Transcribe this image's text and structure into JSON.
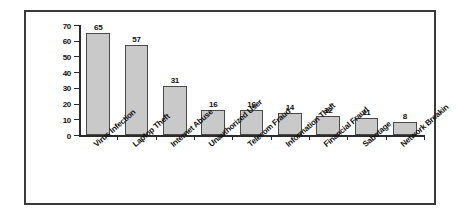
{
  "chart_data": {
    "type": "bar",
    "title": "",
    "subtitle": "",
    "xlabel": "",
    "ylabel": "",
    "ylim": [
      0,
      70
    ],
    "yticks": [
      0,
      10,
      20,
      30,
      40,
      50,
      60,
      70
    ],
    "grid": false,
    "legend": "none",
    "show_value_labels": true,
    "xtick_label_rotation": -41,
    "categories": [
      "Virus Infection",
      "Laptop Theft",
      "Internet Abuse",
      "Unauthorized User",
      "Telecom Fraud",
      "Information Theft",
      "Financial Fraud",
      "Sabotage",
      "Network Breakin"
    ],
    "values": [
      65,
      57,
      31,
      16,
      16,
      14,
      12,
      11,
      8
    ],
    "value_labels": [
      "65",
      "57",
      "31",
      "16",
      "16",
      "14",
      "12",
      "11",
      "8"
    ],
    "ytick_labels": [
      "0",
      "10",
      "20",
      "30",
      "40",
      "50",
      "60",
      "70"
    ],
    "colors": {
      "bar_fill": "#c9c9c9",
      "bar_edge": "#4a4a4a",
      "axis": "#2b2b2b",
      "text": "#111111",
      "frame": "#3a3a3a",
      "background": "#ffffff"
    }
  }
}
